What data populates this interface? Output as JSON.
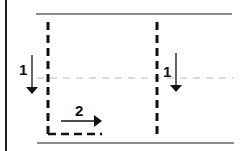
{
  "diagram": {
    "labels": {
      "left_arrow": "1",
      "right_arrow": "1",
      "bottom_arrow": "2"
    },
    "colors": {
      "line": "#555555",
      "dashed_black": "#111111",
      "dashed_gray": "#bbbbbb",
      "frame": "#222222"
    }
  }
}
